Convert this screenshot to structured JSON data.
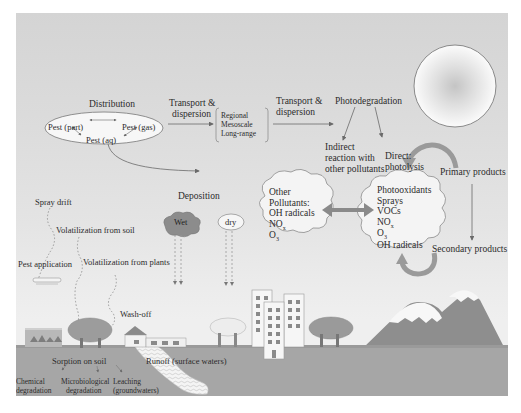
{
  "diagram": {
    "colors": {
      "background_top": "#d4d4d4",
      "background_bottom": "#efefef",
      "ground": "#a9a9a9",
      "mountain": "#8e8e8e",
      "arrow_dark": "#6f6f6f",
      "text": "#2b2b2b"
    },
    "distribution": {
      "label": "Distribution",
      "pest_part": "Pest (part)",
      "pest_gas": "Pest (gas)",
      "pest_aq": "Pest (aq)"
    },
    "transport1": {
      "line1": "Transport &",
      "line2": "dispersion"
    },
    "scales": [
      "Regional",
      "Mesoscale",
      "Long-range"
    ],
    "transport2": {
      "line1": "Transport &",
      "line2": "dispersion"
    },
    "photodegradation": "Photodegradation",
    "indirect": [
      "Indirect",
      "reaction with",
      "other pollutants"
    ],
    "direct": [
      "Direct:",
      "photolysis"
    ],
    "primary_products": "Primary products",
    "secondary_products": "Secondary products",
    "deposition": {
      "label": "Deposition",
      "wet": "Wet",
      "dry": "dry"
    },
    "other_pollutants_cloud": [
      "Other",
      "Pollutants:",
      "OH radicals",
      "NO",
      "O"
    ],
    "photooxidants_cloud": [
      "Photooxidants",
      "Sprays",
      "VOCs",
      "NO",
      "O",
      "OH radicals"
    ],
    "subscripts": {
      "nox": "x",
      "o3": "3"
    },
    "left_labels": {
      "spray_drift": "Spray drift",
      "volatilization_soil": "Volatilization from soil",
      "pest_application": "Pest application",
      "volatilization_plants": "Volatilization from plants",
      "wash_off": "Wash-off"
    },
    "ground_labels": {
      "sorption": "Sorption on soil",
      "runoff": "Runoff (surface waters)",
      "chemical": [
        "Chemical",
        "degradation"
      ],
      "microbiological": [
        "Microbiological",
        "degradation"
      ],
      "leaching": [
        "Leaching",
        "(groundwaters)"
      ]
    }
  }
}
